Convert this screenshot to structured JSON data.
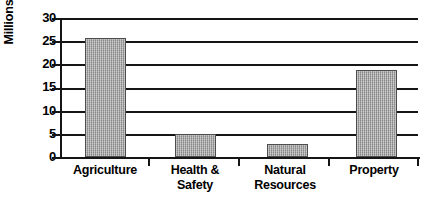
{
  "chart_data": {
    "type": "bar",
    "title": "",
    "xlabel": "",
    "ylabel": "Millions",
    "categories": [
      "Agriculture",
      "Health & Safety",
      "Natural Resources",
      "Property"
    ],
    "values": [
      25.6,
      4.9,
      2.8,
      18.8
    ],
    "ylim": [
      0,
      30
    ],
    "yticks": [
      0,
      5,
      10,
      15,
      20,
      25,
      30
    ],
    "ytick_labels": [
      "0",
      "5",
      "10",
      "15",
      "20",
      "25",
      "30"
    ],
    "grid": true,
    "grid_axis": "y",
    "legend": false,
    "series": [
      {
        "name": "",
        "values": [
          25.6,
          4.9,
          2.8,
          18.8
        ]
      }
    ],
    "category_label_lines": [
      [
        "Agriculture"
      ],
      [
        "Health &",
        "Safety"
      ],
      [
        "Natural",
        "Resources"
      ],
      [
        "Property"
      ]
    ],
    "colors": {
      "bar_fill": "#a3a3a3",
      "bar_border": "#4d4d4d",
      "axis": "#151515",
      "grid": "#151515",
      "text": "#000000",
      "background": "#ffffff"
    }
  }
}
